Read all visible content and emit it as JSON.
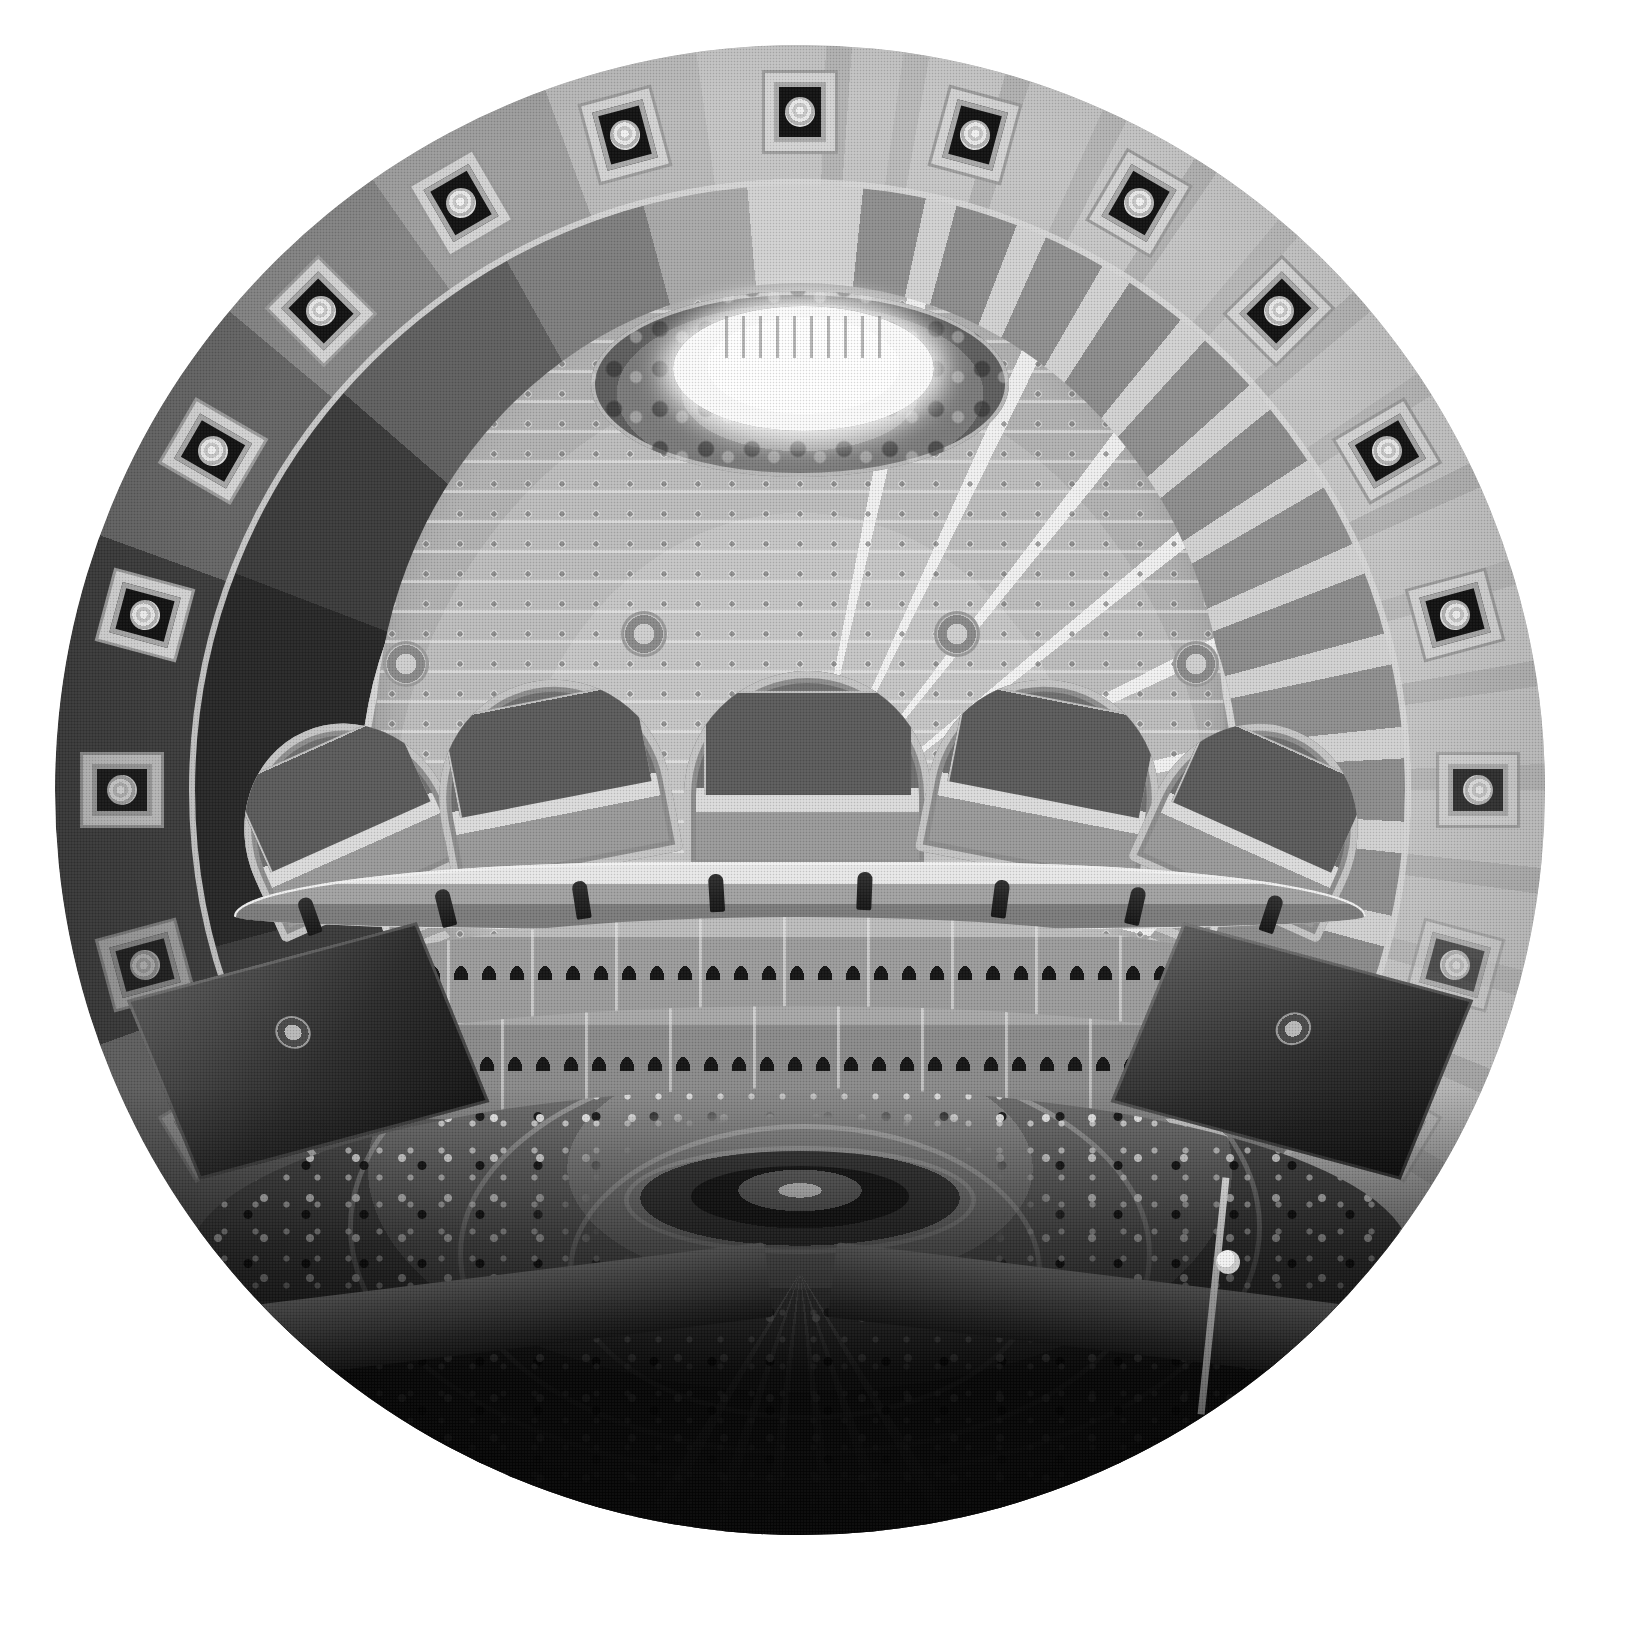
{
  "image": {
    "subject": "Library of Congress Main Reading Room",
    "view": "fisheye-circular-interior-upward-and-down",
    "medium": "black-and-white halftone photograph",
    "orientation": "circular vignette on white page",
    "canvas": {
      "width_px": 1630,
      "height_px": 1628,
      "background_hex": "#ffffff"
    },
    "circle": {
      "center_x_px": 800,
      "center_y_px": 790,
      "radius_px": 745
    },
    "palette": {
      "page_white": "#ffffff",
      "highlight": "#f7f7f7",
      "light_stone": "#d2d2d2",
      "mid_stone": "#a5a5a5",
      "coffer_gray": "#8a8a8a",
      "shadow_gray": "#4e4e4e",
      "deep_shadow": "#141414",
      "foreground_black": "#050505"
    }
  },
  "regions": {
    "oculus": {
      "name": "Lantern / oculus",
      "tone": "blown-out white",
      "color_hex": "#ffffff"
    },
    "collar": {
      "name": "Painted collar frieze beneath the lantern",
      "tone": "dark mottled figures",
      "color_hex": "#7b7b7b"
    },
    "dome": {
      "name": "Ribbed dome with small square coffers",
      "rib_count": 12,
      "coffer_rows": 11,
      "color_hex": "#c6c6c6"
    },
    "cornice": {
      "name": "Dentil cornice band at dome spring",
      "color_hex": "#b0b0b0"
    },
    "ring_inner": {
      "name": "Inner ceiling ring of large plain coffers",
      "coffer_count": 24,
      "color_hex": "#8d8d8d"
    },
    "ring_outer": {
      "name": "Outer ceiling ring with rosette medallion panels",
      "rosette_count": 24,
      "color_hex": "#cfcfcf"
    },
    "arcade": {
      "name": "Arcade of monumental arched clerestory windows",
      "arch_count": 5,
      "color_hex": "#6f6f6f"
    },
    "balustrade": {
      "name": "Statue balustrade above the book alcoves",
      "statue_count": 8,
      "color_hex": "#a2a2a2"
    },
    "alcove_upper": {
      "name": "Upper tier of arched book alcoves",
      "color_hex": "#9c9c9c"
    },
    "alcove_lower": {
      "name": "Lower tier of arched book alcoves",
      "color_hex": "#8a8a8a"
    },
    "floor": {
      "name": "Reading room floor with radiating reader desks",
      "aisle_count": 8,
      "desk_ring_count": 3,
      "color_hex": "#5a5a5a"
    },
    "center_desk": {
      "name": "Central circular reference desk",
      "color_hex": "#1d1d1d"
    },
    "foreground": {
      "name": "Shadowed balcony railing in the foreground",
      "color_hex": "#050505"
    },
    "lamp_globe": {
      "name": "White glass lamp globe on the balcony post",
      "color_hex": "#ffffff"
    }
  },
  "rosettes": [
    {
      "angle_deg": 270
    },
    {
      "angle_deg": 285
    },
    {
      "angle_deg": 300
    },
    {
      "angle_deg": 315
    },
    {
      "angle_deg": 330
    },
    {
      "angle_deg": 345
    },
    {
      "angle_deg": 0
    },
    {
      "angle_deg": 15
    },
    {
      "angle_deg": 30
    },
    {
      "angle_deg": 45
    },
    {
      "angle_deg": 60
    },
    {
      "angle_deg": 75
    },
    {
      "angle_deg": 90
    },
    {
      "angle_deg": 105
    },
    {
      "angle_deg": 120
    },
    {
      "angle_deg": 135
    },
    {
      "angle_deg": 150
    },
    {
      "angle_deg": 165
    },
    {
      "angle_deg": 180
    },
    {
      "angle_deg": 195
    },
    {
      "angle_deg": 210
    },
    {
      "angle_deg": 225
    },
    {
      "angle_deg": 240
    },
    {
      "angle_deg": 255
    }
  ],
  "statues": [
    {
      "left_pct": 6
    },
    {
      "left_pct": 18
    },
    {
      "left_pct": 30
    },
    {
      "left_pct": 42
    },
    {
      "left_pct": 55
    },
    {
      "left_pct": 67
    },
    {
      "left_pct": 79
    },
    {
      "left_pct": 91
    }
  ],
  "pendentives": [
    {
      "left_pct": 22,
      "top_pct": 40
    },
    {
      "left_pct": 38,
      "top_pct": 38
    },
    {
      "left_pct": 59,
      "top_pct": 38
    },
    {
      "left_pct": 75,
      "top_pct": 40
    }
  ],
  "caption": ""
}
